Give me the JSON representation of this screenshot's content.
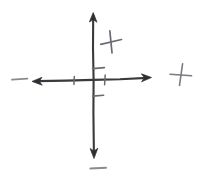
{
  "canvas": {
    "width": 200,
    "height": 177,
    "background_color": "#ffffff",
    "title": "Hand-drawn Cartesian coordinate axes"
  },
  "chart_data": {
    "type": "diagram",
    "title": "Hand-drawn Cartesian coordinate axes",
    "subtitle": "",
    "xlabel": "",
    "ylabel": "",
    "grid": false,
    "legend": "none",
    "style": "hand-drawn sketch",
    "origin": {
      "x": 93,
      "y": 80
    },
    "axes": [
      {
        "name": "horizontal-axis",
        "orientation": "horizontal",
        "x1": 33,
        "y1": 80,
        "x2": 150,
        "y2": 78,
        "arrow_start": true,
        "arrow_end": true,
        "color": "#3a3a3e",
        "stroke_width": 2.1
      },
      {
        "name": "vertical-axis",
        "orientation": "vertical",
        "x1": 93,
        "y1": 13,
        "x2": 94,
        "y2": 157,
        "arrow_start": true,
        "arrow_end": true,
        "color": "#3a3a3e",
        "stroke_width": 2.1
      }
    ],
    "ticks": [
      {
        "name": "tick-x-negative",
        "axis": "horizontal",
        "x": 74,
        "y": 80,
        "length": 8,
        "color": "#6a6a70"
      },
      {
        "name": "tick-x-positive",
        "axis": "horizontal",
        "x": 105,
        "y": 79,
        "length": 10,
        "color": "#6a6a70"
      },
      {
        "name": "tick-y-positive",
        "axis": "vertical",
        "x": 93,
        "y": 68,
        "length": 12,
        "color": "#6a6a70"
      },
      {
        "name": "tick-y-negative",
        "axis": "vertical",
        "x": 93,
        "y": 96,
        "length": 11,
        "color": "#6a6a70"
      }
    ],
    "signs": [
      {
        "name": "plus-upper-right-quadrant",
        "symbol": "+",
        "x": 111,
        "y": 42,
        "size": 20,
        "rotation": -10,
        "color": "#6b6b71",
        "quadrant": "I-inner"
      },
      {
        "name": "plus-right-outer",
        "symbol": "+",
        "x": 181,
        "y": 75,
        "size": 20,
        "rotation": 6,
        "color": "#7a7a80",
        "quadrant": "right-of-axis"
      },
      {
        "name": "minus-left-outer",
        "symbol": "−",
        "x": 20,
        "y": 79,
        "size": 17,
        "rotation": 0,
        "color": "#8a8a90",
        "quadrant": "left-of-axis"
      },
      {
        "name": "minus-bottom-outer",
        "symbol": "−",
        "x": 98,
        "y": 168,
        "size": 17,
        "rotation": 0,
        "color": "#8a8a90",
        "quadrant": "below-axis"
      }
    ],
    "colors": {
      "axis": "#3a3a3e",
      "tick": "#6a6a70",
      "sign_dark": "#6b6b71",
      "sign_light": "#8a8a90",
      "background": "#ffffff"
    }
  },
  "labels": {
    "diagram_name": "Hand-drawn Cartesian coordinate axes",
    "horizontal_axis": "horizontal axis",
    "vertical_axis": "vertical axis",
    "plus_upper_right": "+",
    "plus_right": "+",
    "minus_left": "−",
    "minus_bottom": "−"
  }
}
